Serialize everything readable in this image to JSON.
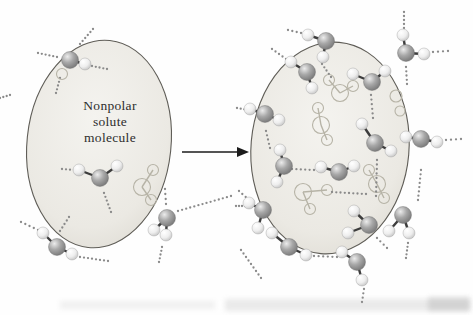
{
  "figure": {
    "background": "#fefefe",
    "label": {
      "lines": [
        "Nonpolar",
        "solute",
        "molecule"
      ]
    },
    "arrow": {
      "x1": 182,
      "y1": 152,
      "x2": 237,
      "y2": 152,
      "tip": 249,
      "color": "#1b1b1b"
    },
    "style": {
      "dot_color": "#8a8a8a",
      "dot_radius": 1.15,
      "dot_spacing": 4.3,
      "bond_color": "#3c3c3c",
      "bond_width": 2.4,
      "ghost_color": "#b6b3a6",
      "oval_stroke": "#5f5d57",
      "oxygen_radius": 8.5,
      "hydrogen_radius": 6,
      "ghost_oxygen_radius": 8.5,
      "ghost_hydrogen_radius": 5.5,
      "oxygen_color": "#9a9a9a",
      "hydrogen_color": "#e8e8e8",
      "oval_fill_light": "#f4f3ef",
      "oval_fill_dark": "#dcd9d1"
    },
    "left": {
      "oval": {
        "cx": 99,
        "cy": 144,
        "rx": 72,
        "ry": 104,
        "rotate": 6
      },
      "waters": [
        {
          "o": [
            70,
            60
          ],
          "h": [
            [
              85,
              64
            ]
          ],
          "gh": [
            [
              62,
              74
            ]
          ]
        },
        {
          "o": [
            100,
            178
          ],
          "h": [
            [
              79,
              170
            ],
            [
              117,
              166
            ]
          ]
        },
        {
          "o": [
            57,
            247
          ],
          "h": [
            [
              43,
              233
            ],
            [
              72,
              254
            ]
          ]
        },
        {
          "o": [
            167,
            218
          ],
          "h": [
            [
              154,
              230
            ],
            [
              166,
              235
            ]
          ]
        }
      ],
      "ghosts": [
        {
          "o": [
            142,
            187
          ],
          "h": [
            [
              153,
              170
            ],
            [
              151,
              200
            ]
          ]
        }
      ],
      "ghost_circles": [],
      "hbonds": [
        [
          80,
          44,
          93,
          29
        ],
        [
          38,
          53,
          57,
          57
        ],
        [
          92,
          66,
          107,
          69
        ],
        [
          60,
          78,
          56,
          93
        ],
        [
          0,
          98,
          10,
          95
        ],
        [
          62,
          169,
          74,
          170
        ],
        [
          104,
          193,
          111,
          212
        ],
        [
          60,
          231,
          69,
          217
        ],
        [
          21,
          222,
          38,
          230
        ],
        [
          80,
          257,
          108,
          261
        ],
        [
          165,
          189,
          166,
          204
        ],
        [
          162,
          247,
          159,
          262
        ],
        [
          178,
          211,
          231,
          196
        ]
      ]
    },
    "right": {
      "oval": {
        "cx": 330,
        "cy": 148,
        "rx": 79,
        "ry": 106,
        "rotate": 5
      },
      "waters": [
        {
          "o": [
            326,
            41
          ],
          "h": [
            [
              308,
              35
            ],
            [
              323,
              57
            ]
          ]
        },
        {
          "o": [
            307,
            72
          ],
          "h": [
            [
              291,
              62
            ],
            [
              312,
              88
            ]
          ]
        },
        {
          "o": [
            265,
            114
          ],
          "h": [
            [
              250,
              109
            ],
            [
              279,
              120
            ]
          ]
        },
        {
          "o": [
            284,
            166
          ],
          "h": [
            [
              280,
              150
            ],
            [
              277,
              182
            ]
          ]
        },
        {
          "o": [
            339,
            172
          ],
          "h": [
            [
              321,
              167
            ],
            [
              354,
              166
            ]
          ]
        },
        {
          "o": [
            375,
            143
          ],
          "h": [
            [
              362,
              124
            ],
            [
              391,
              151
            ]
          ]
        },
        {
          "o": [
            372,
            82
          ],
          "h": [
            [
              353,
              74
            ],
            [
              385,
              71
            ]
          ]
        },
        {
          "o": [
            421,
            139
          ],
          "h": [
            [
              406,
              137
            ],
            [
              437,
              142
            ]
          ]
        },
        {
          "o": [
            406,
            53
          ],
          "h": [
            [
              403,
              35
            ],
            [
              424,
              54
            ]
          ]
        },
        {
          "o": [
            403,
            215
          ],
          "h": [
            [
              389,
              231
            ],
            [
              409,
              233
            ]
          ]
        },
        {
          "o": [
            369,
            225
          ],
          "h": [
            [
              354,
              211
            ],
            [
              348,
              233
            ]
          ]
        },
        {
          "o": [
            357,
            262
          ],
          "h": [
            [
              342,
              252
            ],
            [
              362,
              280
            ]
          ]
        },
        {
          "o": [
            263,
            210
          ],
          "h": [
            [
              249,
              203
            ],
            [
              258,
              228
            ]
          ]
        },
        {
          "o": [
            289,
            247
          ],
          "h": [
            [
              272,
              233
            ],
            [
              306,
              255
            ]
          ]
        }
      ],
      "ghosts": [
        {
          "o": [
            340,
            93
          ],
          "h": [
            [
              329,
              80
            ],
            [
              353,
              86
            ]
          ]
        },
        {
          "o": [
            321,
            125
          ],
          "h": [
            [
              318,
              108
            ],
            [
              327,
              140
            ]
          ]
        },
        {
          "o": [
            303,
            192
          ],
          "h": [
            [
              327,
              190
            ],
            [
              310,
              209
            ]
          ]
        },
        {
          "o": [
            377,
            184
          ],
          "h": [
            [
              369,
              170
            ],
            [
              384,
              198
            ]
          ]
        }
      ],
      "ghost_circles": [
        [
          396,
          96,
          6
        ],
        [
          400,
          111,
          5
        ]
      ],
      "hbonds": [
        [
          288,
          30,
          301,
          33
        ],
        [
          272,
          49,
          286,
          59
        ],
        [
          237,
          108,
          248,
          110
        ],
        [
          266,
          131,
          270,
          148
        ],
        [
          292,
          169,
          314,
          170
        ],
        [
          322,
          64,
          331,
          77
        ],
        [
          371,
          95,
          373,
          118
        ],
        [
          377,
          160,
          376,
          196
        ],
        [
          446,
          140,
          461,
          139
        ],
        [
          421,
          170,
          418,
          200
        ],
        [
          404,
          12,
          404,
          28
        ],
        [
          433,
          52,
          448,
          51
        ],
        [
          406,
          67,
          407,
          84
        ],
        [
          408,
          243,
          406,
          258
        ],
        [
          377,
          238,
          387,
          248
        ],
        [
          364,
          289,
          362,
          302
        ],
        [
          239,
          191,
          249,
          200
        ],
        [
          236,
          206,
          245,
          206
        ],
        [
          314,
          256,
          337,
          257
        ],
        [
          241,
          250,
          261,
          278
        ],
        [
          332,
          192,
          366,
          194
        ]
      ]
    },
    "artifacts": [
      {
        "x": 225,
        "y": 299,
        "w": 245,
        "h": 12,
        "opacity": 0.2
      },
      {
        "x": 60,
        "y": 301,
        "w": 155,
        "h": 8,
        "opacity": 0.13
      },
      {
        "x": 428,
        "y": 297,
        "w": 42,
        "h": 14,
        "opacity": 0.28
      }
    ]
  }
}
